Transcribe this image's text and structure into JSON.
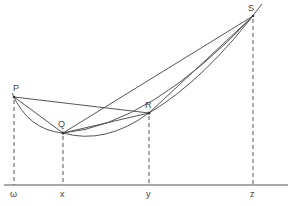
{
  "diagram": {
    "points": [
      {
        "name": "P",
        "label": "P",
        "x": 14,
        "y": 97,
        "lx": 13,
        "ly": 91
      },
      {
        "name": "Q",
        "label": "Q",
        "x": 63,
        "y": 133,
        "lx": 58,
        "ly": 127
      },
      {
        "name": "R",
        "label": "R",
        "x": 149,
        "y": 113,
        "lx": 145,
        "ly": 108
      },
      {
        "name": "S",
        "label": "S",
        "x": 253,
        "y": 16,
        "lx": 248,
        "ly": 11
      }
    ],
    "axis": {
      "baseline_y": 185,
      "ticks": [
        {
          "label": "ω",
          "x": 14
        },
        {
          "label": "x",
          "x": 63
        },
        {
          "label": "y",
          "x": 149
        },
        {
          "label": "z",
          "x": 253
        }
      ]
    },
    "chords": [
      "P-R",
      "P-Q",
      "Q-R",
      "Q-S",
      "R-S"
    ],
    "curves": [
      "P-Q-R-S convex curve"
    ],
    "colors": {
      "line": "#555555",
      "text": "#444444",
      "background": "#ffffff"
    }
  }
}
